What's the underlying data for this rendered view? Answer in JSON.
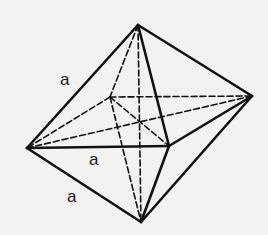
{
  "figure": {
    "background_color": "#f2f2f0",
    "stroke_color": "#111111",
    "labels": [
      {
        "text": "a",
        "x": 60,
        "y": 70,
        "edge": "top-left"
      },
      {
        "text": "a",
        "x": 89,
        "y": 150,
        "edge": "left-front"
      },
      {
        "text": "a",
        "x": 67,
        "y": 187,
        "edge": "bottom-left"
      }
    ],
    "vertices": {
      "top": [
        138,
        25
      ],
      "bottom": [
        141,
        222
      ],
      "left": [
        27,
        148
      ],
      "front": [
        169,
        146
      ],
      "right": [
        252,
        96
      ],
      "back": [
        110,
        97
      ]
    },
    "solid_edges": [
      [
        "top",
        "left"
      ],
      [
        "top",
        "front"
      ],
      [
        "top",
        "right"
      ],
      [
        "left",
        "front"
      ],
      [
        "front",
        "right"
      ],
      [
        "bottom",
        "left"
      ],
      [
        "bottom",
        "front"
      ],
      [
        "bottom",
        "right"
      ]
    ],
    "dashed_edges": [
      [
        "top",
        "back"
      ],
      [
        "back",
        "left"
      ],
      [
        "back",
        "right"
      ],
      [
        "back",
        "bottom"
      ],
      [
        "top",
        "bottom"
      ],
      [
        "left",
        "right"
      ],
      [
        "back",
        "front"
      ]
    ]
  }
}
